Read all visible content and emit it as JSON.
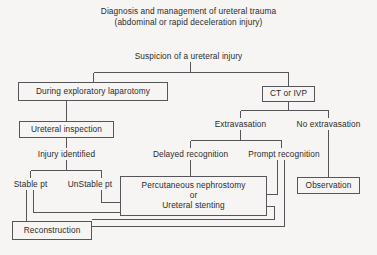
{
  "diagram": {
    "title_line1": "Diagnosis and management of ureteral trauma",
    "title_line2": "(abdominal or rapid deceleration injury)",
    "root": "Suspicion of a ureteral injury",
    "nodes": {
      "laparotomy": "During exploratory laparotomy",
      "ct_ivp": "CT or IVP",
      "ureteral_inspection": "Ureteral inspection",
      "injury_identified": "Injury identified",
      "extravasation": "Extravasation",
      "no_extravasation": "No extravasation",
      "delayed_recognition": "Delayed recognition",
      "prompt_recognition": "Prompt recognition",
      "stable_pt": "Stable pt",
      "unstable_pt": "UnStable pt",
      "nephrostomy_line1": "Percutaneous nephrostomy",
      "nephrostomy_line2": "or",
      "nephrostomy_line3": "Ureteral stenting",
      "observation": "Observation",
      "reconstruction": "Reconstruction"
    },
    "colors": {
      "background": "#f6f5f3",
      "line": "#56565a",
      "text": "#2b2b2b"
    }
  }
}
